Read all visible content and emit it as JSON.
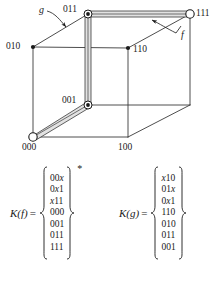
{
  "figure": {
    "type": "cube-diagram",
    "vertices": [
      {
        "id": "010",
        "label": "010",
        "marker": "filled-dot",
        "x": 33,
        "y": 47
      },
      {
        "id": "011",
        "label": "011",
        "marker": "circled-dot",
        "x": 88,
        "y": 14
      },
      {
        "id": "110",
        "label": "110",
        "marker": "filled-dot",
        "x": 128,
        "y": 48
      },
      {
        "id": "111",
        "label": "111",
        "marker": "open-circle",
        "x": 190,
        "y": 14
      },
      {
        "id": "000",
        "label": "000",
        "marker": "open-circle",
        "x": 33,
        "y": 137
      },
      {
        "id": "001",
        "label": "001",
        "marker": "circled-dot",
        "x": 88,
        "y": 105
      },
      {
        "id": "100",
        "label": "100",
        "marker": "none",
        "x": 128,
        "y": 137
      },
      {
        "id": "101",
        "label": "",
        "marker": "none",
        "x": 190,
        "y": 105
      }
    ],
    "annotations": [
      {
        "id": "g",
        "label": "g",
        "points_to": "edge-010-011"
      },
      {
        "id": "f",
        "label": "f",
        "points_to": "edge-011-111"
      }
    ],
    "highlighted_edges": [
      "011-111",
      "011-001",
      "001-000"
    ]
  },
  "matrices": [
    {
      "name": "K(f)",
      "name_head": "K",
      "name_arg": "f",
      "equals": "=",
      "superscript": "*",
      "rows": [
        "00x",
        "0x1",
        "x11",
        "000",
        "001",
        "011",
        "111"
      ]
    },
    {
      "name": "K(g)",
      "name_head": "K",
      "name_arg": "g",
      "equals": "=",
      "superscript": "",
      "rows": [
        "x10",
        "01x",
        "0x1",
        "110",
        "010",
        "011",
        "001"
      ]
    }
  ],
  "colors": {
    "ink": "#1a1a1a",
    "line": "#3a3a3a",
    "highlight_fill": "#d8d8d8",
    "background": "#ffffff"
  }
}
